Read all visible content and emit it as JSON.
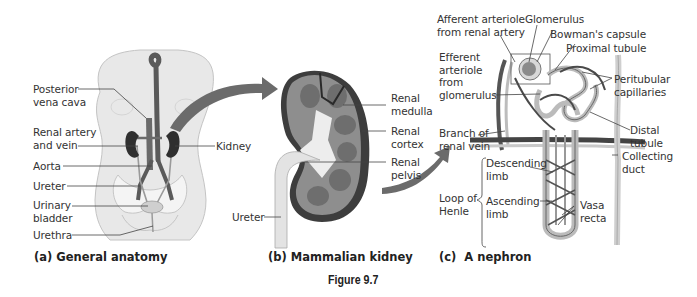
{
  "figure": {
    "number_label": "Figure 9.7",
    "colors": {
      "body_fill": "#e6e6e6",
      "body_outline": "#bdbdbd",
      "vessel": "#555555",
      "kidney_dark": "#3a3a3a",
      "kidney_cortex": "#8a8a8a",
      "arrow": "#6b6b6b",
      "leader": "#444444"
    }
  },
  "panels": [
    {
      "id": "a",
      "caption": "(a) General anatomy",
      "labels": [
        {
          "text": "Posterior\nvena cava"
        },
        {
          "text": "Renal artery\nand vein"
        },
        {
          "text": "Aorta"
        },
        {
          "text": "Ureter"
        },
        {
          "text": "Urinary\nbladder"
        },
        {
          "text": "Urethra"
        },
        {
          "text": "Kidney"
        }
      ]
    },
    {
      "id": "b",
      "caption": "(b) Mammalian kidney",
      "labels": [
        {
          "text": "Renal\nmedulla"
        },
        {
          "text": "Renal\ncortex"
        },
        {
          "text": "Renal\npelvis"
        },
        {
          "text": "Ureter"
        }
      ]
    },
    {
      "id": "c",
      "caption": "(c)  A nephron",
      "labels": [
        {
          "text": "Afferent arteriole\nfrom renal artery"
        },
        {
          "text": "Glomerulus"
        },
        {
          "text": "Bowman's capsule"
        },
        {
          "text": "Proximal tubule"
        },
        {
          "text": "Efferent\narteriole\nfrom\nglomerulus"
        },
        {
          "text": "Peritubular\ncapillaries"
        },
        {
          "text": "Distal\ntubule"
        },
        {
          "text": "Branch of\nrenal vein"
        },
        {
          "text": "Collecting\nduct"
        },
        {
          "text": "Descending\nlimb"
        },
        {
          "text": "Ascending\nlimb"
        },
        {
          "text": "Loop of\nHenle"
        },
        {
          "text": "Vasa\nrecta"
        }
      ]
    }
  ]
}
